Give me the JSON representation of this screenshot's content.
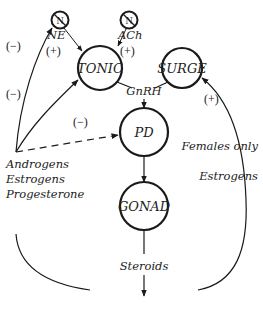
{
  "diagram": {
    "nodes": {
      "n_left": "N",
      "n_right": "N",
      "tonic": "TONIC",
      "surge": "SURGE",
      "pd": "PD",
      "gonad": "GONAD"
    },
    "labels": {
      "ne": "NE",
      "ach": "ACh",
      "gnrh": "GnRH",
      "steroids": "Steroids",
      "androgens": "Androgens",
      "estrogens_left": "Estrogens",
      "progesterone": "Progesterone",
      "females_only": "Females only",
      "estrogens_right": "Estrogens"
    },
    "signs": {
      "ne_effect": "(+)",
      "ach_effect": "(+)",
      "feedback_to_n": "(−)",
      "feedback_to_tonic": "(−)",
      "feedback_to_pd": "(−)",
      "estrogen_to_surge": "(+)"
    },
    "edges": [
      {
        "from": "N (left)",
        "to": "TONIC",
        "label": "NE",
        "sign": "+"
      },
      {
        "from": "N (right)",
        "to": "TONIC",
        "label": "ACh",
        "sign": "+"
      },
      {
        "from": "TONIC",
        "to": "PD",
        "label": "GnRH"
      },
      {
        "from": "SURGE",
        "to": "PD",
        "label": "GnRH"
      },
      {
        "from": "PD",
        "to": "GONAD"
      },
      {
        "from": "GONAD",
        "to": "output",
        "label": "Steroids"
      },
      {
        "from": "Androgens/Estrogens/Progesterone",
        "to": "N (left)",
        "sign": "-"
      },
      {
        "from": "Androgens/Estrogens/Progesterone",
        "to": "TONIC",
        "sign": "-"
      },
      {
        "from": "Androgens/Estrogens/Progesterone",
        "to": "PD",
        "sign": "-",
        "style": "dashed"
      },
      {
        "from": "Steroids",
        "to": "SURGE",
        "label": "Estrogens (Females only)",
        "sign": "+"
      }
    ]
  }
}
